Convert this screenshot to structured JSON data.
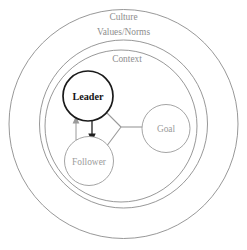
{
  "diagram": {
    "type": "concentric-nested-circles-with-nodes",
    "background_color": "#ffffff",
    "rings": [
      {
        "id": "culture",
        "label_line_1": "Culture",
        "label_line_2": "Values/Norms",
        "stroke_color": "#8c8c8c",
        "text_color": "#8e8e8e"
      },
      {
        "id": "context",
        "label": "Context",
        "stroke_color": "#8c8c8c",
        "text_color": "#8e8e8e"
      },
      {
        "id": "inner-boundary",
        "label": "",
        "stroke_color": "#8c8c8c"
      }
    ],
    "nodes": [
      {
        "id": "leader",
        "label": "Leader",
        "emphasis": "bold-dark",
        "stroke_color": "#1a1a1a",
        "text_color": "#141414"
      },
      {
        "id": "follower",
        "label": "Follower",
        "emphasis": "light",
        "stroke_color": "#9a9a9a",
        "text_color": "#9b9b9b"
      },
      {
        "id": "goal",
        "label": "Goal",
        "emphasis": "light",
        "stroke_color": "#9a9a9a",
        "text_color": "#9b9b9b"
      }
    ],
    "connectors": [
      {
        "id": "leader-to-follower",
        "from": "leader",
        "to": "follower",
        "style": "arrow-dark-down",
        "color": "#1f1f1f"
      },
      {
        "id": "follower-to-leader",
        "from": "follower",
        "to": "leader",
        "style": "arrow-light-up",
        "color": "#9a9a9a"
      },
      {
        "id": "leader-to-junction",
        "from": "leader",
        "to": "junction",
        "style": "plain-line-light",
        "color": "#9a9a9a"
      },
      {
        "id": "follower-to-junction",
        "from": "follower",
        "to": "junction",
        "style": "plain-line-light",
        "color": "#9a9a9a"
      },
      {
        "id": "junction-to-goal",
        "from": "junction",
        "to": "goal",
        "style": "plain-line-light",
        "color": "#9a9a9a"
      }
    ]
  }
}
